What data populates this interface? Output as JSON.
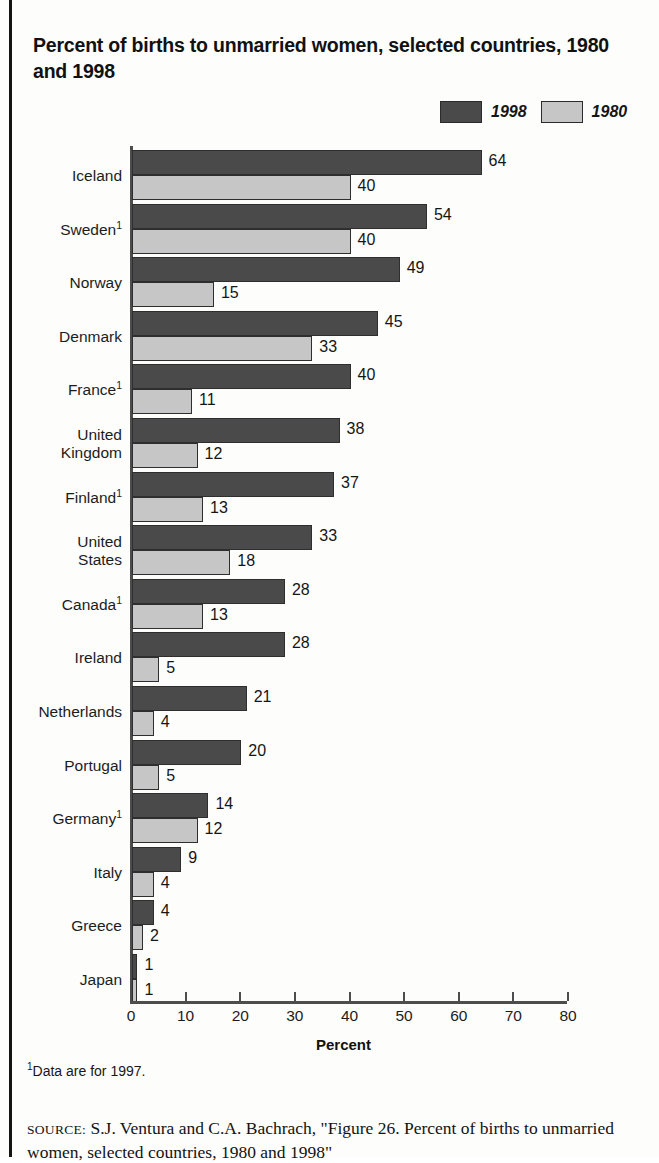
{
  "figure": {
    "title": "Percent of births to unmarried women, selected countries, 1980 and 1998",
    "axis_title": "Percent",
    "footnote_marker": "1",
    "footnote_text": "Data are for 1997.",
    "source_prefix": "SOURCE:",
    "source_text": " S.J. Ventura and C.A. Bachrach, \"Figure 26. Percent of births to unmarried women, selected countries, 1980 and 1998\"",
    "colors": {
      "series_1998": "#4a4a4a",
      "series_1980": "#c6c6c6",
      "axis": "#4d4d4d",
      "text": "#1a1a1a",
      "background": "#fdfdfc"
    }
  },
  "legend": {
    "items": [
      {
        "label": "1998",
        "swatch": "dark"
      },
      {
        "label": "1980",
        "swatch": "light"
      }
    ]
  },
  "chart_data": {
    "type": "bar",
    "orientation": "horizontal",
    "title": "Percent of births to unmarried women, selected countries, 1980 and 1998",
    "xlabel": "Percent",
    "ylabel": "",
    "xlim": [
      0,
      80
    ],
    "xticks": [
      0,
      10,
      20,
      30,
      40,
      50,
      60,
      70,
      80
    ],
    "xtick_labels": [
      "0",
      "10",
      "20",
      "30",
      "40",
      "50",
      "60",
      "70",
      "80"
    ],
    "grid": false,
    "legend_position": "top-right",
    "categories": [
      "Iceland",
      "Sweden",
      "Norway",
      "Denmark",
      "France",
      "United Kingdom",
      "Finland",
      "United States",
      "Canada",
      "Ireland",
      "Netherlands",
      "Portugal",
      "Germany",
      "Italy",
      "Greece",
      "Japan"
    ],
    "category_labels": [
      [
        "Iceland"
      ],
      [
        "Sweden"
      ],
      [
        "Norway"
      ],
      [
        "Denmark"
      ],
      [
        "France"
      ],
      [
        "United",
        "Kingdom"
      ],
      [
        "Finland"
      ],
      [
        "United",
        "States"
      ],
      [
        "Canada"
      ],
      [
        "Ireland"
      ],
      [
        "Netherlands"
      ],
      [
        "Portugal"
      ],
      [
        "Germany"
      ],
      [
        "Italy"
      ],
      [
        "Greece"
      ],
      [
        "Japan"
      ]
    ],
    "category_footnotes": [
      false,
      true,
      false,
      false,
      true,
      false,
      true,
      false,
      true,
      false,
      false,
      false,
      true,
      false,
      false,
      false
    ],
    "series": [
      {
        "name": "1998",
        "color": "#4a4a4a",
        "values": [
          64,
          54,
          49,
          45,
          40,
          38,
          37,
          33,
          28,
          28,
          21,
          20,
          14,
          9,
          4,
          1
        ]
      },
      {
        "name": "1980",
        "color": "#c6c6c6",
        "values": [
          40,
          40,
          15,
          33,
          11,
          12,
          13,
          18,
          13,
          5,
          4,
          5,
          12,
          4,
          2,
          1
        ]
      }
    ]
  }
}
